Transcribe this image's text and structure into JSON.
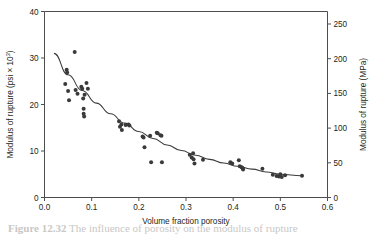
{
  "figure": {
    "caption_label": "Figure 12.32",
    "caption_text": "The influence of porosity on the modulus of rupture"
  },
  "chart_data": {
    "type": "scatter",
    "title": "",
    "xlabel": "Volume fraction porosity",
    "ylabel": "Modulus of rupture (psi × 10³)",
    "ylabel_right": "Modulus of rupture (MPa)",
    "ylabel_right_parts": {
      "text": "Modulus of rupture (MPa)"
    },
    "ylabel_left_parts": {
      "main": "Modulus of rupture (psi × 10",
      "sup": "3",
      "tail": ")"
    },
    "xlim": [
      0.0,
      0.6
    ],
    "ylim": [
      0,
      40
    ],
    "ylim_right": [
      0,
      268
    ],
    "xticks": [
      "0.0",
      "0.1",
      "0.2",
      "0.3",
      "0.4",
      "0.5",
      "0.6"
    ],
    "xtick_values": [
      0.0,
      0.1,
      0.2,
      0.3,
      0.4,
      0.5,
      0.6
    ],
    "yticks_left": [
      "0",
      "10",
      "20",
      "30",
      "40"
    ],
    "ytick_left_values": [
      0,
      10,
      20,
      30,
      40
    ],
    "yticks_right": [
      "0",
      "50",
      "100",
      "150",
      "200",
      "250"
    ],
    "ytick_right_values": [
      0,
      50,
      100,
      150,
      200,
      250
    ],
    "grid": false,
    "legend": "none",
    "marker": "filled-circle",
    "marker_color": "#3a3a3a",
    "curve_color": "#3c3c3c",
    "axis_color": "#4d4d4d",
    "points": [
      [
        0.044,
        24.4
      ],
      [
        0.047,
        27.5
      ],
      [
        0.048,
        26.9
      ],
      [
        0.05,
        22.9
      ],
      [
        0.052,
        20.9
      ],
      [
        0.064,
        31.3
      ],
      [
        0.066,
        23.1
      ],
      [
        0.07,
        22.3
      ],
      [
        0.078,
        23.8
      ],
      [
        0.08,
        23.4
      ],
      [
        0.082,
        21.3
      ],
      [
        0.083,
        19.1
      ],
      [
        0.083,
        18.0
      ],
      [
        0.084,
        17.4
      ],
      [
        0.085,
        22.1
      ],
      [
        0.089,
        24.6
      ],
      [
        0.092,
        23.4
      ],
      [
        0.158,
        16.4
      ],
      [
        0.16,
        15.2
      ],
      [
        0.163,
        15.7
      ],
      [
        0.164,
        14.5
      ],
      [
        0.172,
        15.6
      ],
      [
        0.178,
        15.7
      ],
      [
        0.18,
        15.5
      ],
      [
        0.208,
        13.1
      ],
      [
        0.21,
        12.9
      ],
      [
        0.212,
        10.8
      ],
      [
        0.224,
        13.3
      ],
      [
        0.226,
        7.6
      ],
      [
        0.238,
        13.9
      ],
      [
        0.24,
        13.8
      ],
      [
        0.246,
        13.4
      ],
      [
        0.248,
        13.3
      ],
      [
        0.249,
        7.6
      ],
      [
        0.308,
        9.2
      ],
      [
        0.312,
        8.6
      ],
      [
        0.315,
        9.5
      ],
      [
        0.316,
        8.2
      ],
      [
        0.318,
        7.3
      ],
      [
        0.336,
        8.1
      ],
      [
        0.394,
        7.6
      ],
      [
        0.398,
        7.3
      ],
      [
        0.412,
        8.0
      ],
      [
        0.414,
        6.7
      ],
      [
        0.418,
        6.5
      ],
      [
        0.42,
        6.3
      ],
      [
        0.421,
        6.0
      ],
      [
        0.462,
        6.2
      ],
      [
        0.484,
        4.9
      ],
      [
        0.492,
        4.6
      ],
      [
        0.497,
        4.5
      ],
      [
        0.5,
        5.0
      ],
      [
        0.503,
        4.4
      ],
      [
        0.51,
        4.8
      ],
      [
        0.546,
        4.7
      ]
    ],
    "fit_curve": {
      "description": "exponential decay fit",
      "x": [
        0.02,
        0.05,
        0.08,
        0.11,
        0.14,
        0.17,
        0.2,
        0.23,
        0.26,
        0.29,
        0.32,
        0.35,
        0.38,
        0.41,
        0.44,
        0.47,
        0.5,
        0.545
      ],
      "y": [
        31.0,
        26.4,
        23.0,
        20.3,
        18.0,
        16.0,
        14.2,
        12.7,
        11.3,
        10.1,
        9.1,
        8.2,
        7.4,
        6.7,
        6.1,
        5.5,
        5.0,
        4.7
      ]
    }
  }
}
